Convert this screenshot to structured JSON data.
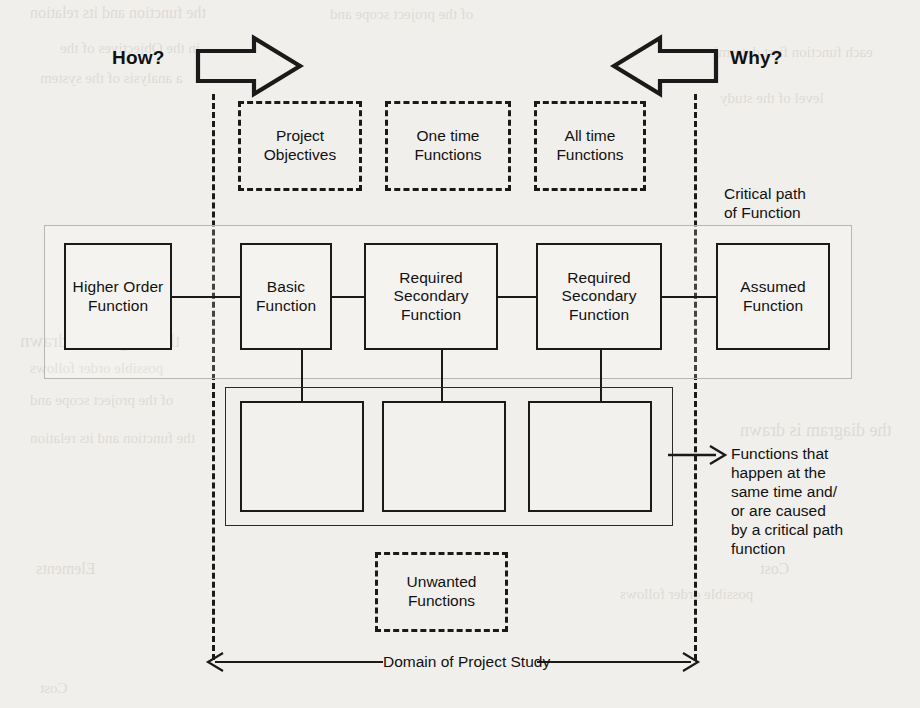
{
  "diagram": {
    "direction_labels": {
      "how": "How?",
      "why": "Why?"
    },
    "scope_boxes": [
      {
        "id": "project-objectives",
        "label": "Project\nObjectives"
      },
      {
        "id": "one-time-functions",
        "label": "One time\nFunctions"
      },
      {
        "id": "all-time-functions",
        "label": "All time\nFunctions"
      }
    ],
    "critical_path": {
      "annotation": "Critical path\nof Function",
      "functions": [
        {
          "id": "higher-order-function",
          "label": "Higher\nOrder\nFunction"
        },
        {
          "id": "basic-function",
          "label": "Basic\nFunction"
        },
        {
          "id": "required-secondary-function-1",
          "label": "Required\nSecondary\nFunction"
        },
        {
          "id": "required-secondary-function-2",
          "label": "Required\nSecondary\nFunction"
        },
        {
          "id": "assumed-function",
          "label": "Assumed\nFunction"
        }
      ]
    },
    "supporting_functions": {
      "annotation": "Functions that\nhappen at the\nsame time and/\nor are caused\nby a critical path\nfunction",
      "boxes": [
        {
          "id": "supporting-function-1",
          "label": ""
        },
        {
          "id": "supporting-function-2",
          "label": ""
        },
        {
          "id": "supporting-function-3",
          "label": ""
        }
      ]
    },
    "unwanted": {
      "id": "unwanted-functions",
      "label": "Unwanted\nFunctions"
    },
    "domain": {
      "label": "Domain of Project Study"
    },
    "colors": {
      "ink": "#1a1a1a",
      "paper": "#f1efeb",
      "critical_path_outline": "#b9b6b1"
    }
  },
  "page_bleed": [
    "the function and its relation",
    "of the project scope and",
    "each function first determine",
    "a analysis of the system",
    "level of the study",
    "in the Objectives of the",
    "the diagram is drawn",
    "possible order follows",
    "Elements",
    "Cost"
  ]
}
